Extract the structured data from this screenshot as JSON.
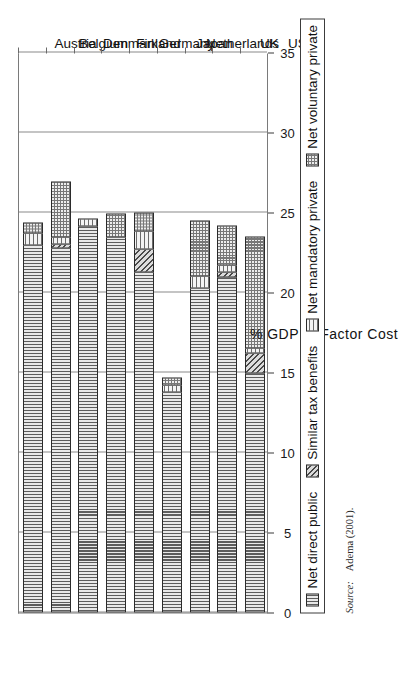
{
  "figure": {
    "orientation": "rotated-90-ccw",
    "source_label": "Source:",
    "source_value": "Adema (2001)."
  },
  "legend": {
    "items": [
      {
        "label": "Net direct public",
        "pattern": "vertical-lines"
      },
      {
        "label": "Similar tax benefits",
        "pattern": "diagonal-lines"
      },
      {
        "label": "Net mandatory private",
        "pattern": "horizontal-lines"
      },
      {
        "label": "Net voluntary private",
        "pattern": "dotted-grid"
      }
    ]
  },
  "chart_data": {
    "type": "bar",
    "stacked": true,
    "title": "",
    "xlabel": "",
    "ylabel": "% GDP at Factor Cost",
    "ylim": [
      0,
      35
    ],
    "yticks": [
      0,
      5,
      10,
      15,
      20,
      25,
      30,
      35
    ],
    "ytick_labels": [
      "0",
      "5",
      "10",
      "15",
      "20",
      "25",
      "30",
      "35"
    ],
    "grid": true,
    "legend_position": "below-axis",
    "categories": [
      "Austria",
      "Belgium",
      "Denmark",
      "Finland",
      "Germany",
      "Japan",
      "Netherlands",
      "UK",
      "US"
    ],
    "series": [
      {
        "name": "Net direct public",
        "pattern": "vertical-lines",
        "values": [
          23.0,
          22.8,
          24.2,
          23.5,
          21.3,
          13.8,
          20.3,
          21.0,
          15.0
        ]
      },
      {
        "name": "Similar tax benefits",
        "pattern": "diagonal-lines",
        "values": [
          0.0,
          0.3,
          0.0,
          0.0,
          1.5,
          0.0,
          0.0,
          0.4,
          1.3
        ]
      },
      {
        "name": "Net mandatory private",
        "pattern": "horizontal-lines",
        "values": [
          0.8,
          0.5,
          0.5,
          0.0,
          1.2,
          0.5,
          0.8,
          0.5,
          0.4
        ]
      },
      {
        "name": "Net voluntary private",
        "pattern": "dotted-grid",
        "values": [
          0.7,
          3.5,
          0.0,
          1.5,
          1.2,
          0.5,
          3.5,
          2.5,
          7.0
        ]
      }
    ],
    "totals": [
      24.5,
      27.1,
      24.7,
      25.0,
      25.2,
      14.8,
      24.6,
      24.4,
      23.7
    ]
  }
}
